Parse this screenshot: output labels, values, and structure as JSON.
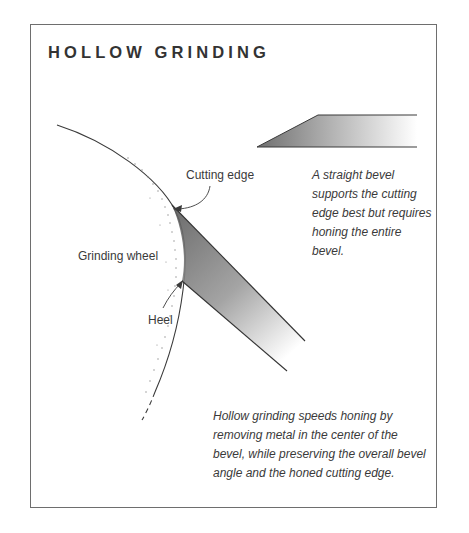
{
  "title": "HOLLOW GRINDING",
  "labels": {
    "cutting_edge": "Cutting edge",
    "grinding_wheel": "Grinding wheel",
    "heel": "Heel"
  },
  "captions": {
    "straight_bevel": "A straight bevel supports the cutting edge best but requires honing the entire bevel.",
    "hollow_grinding": "Hollow grinding speeds honing by removing metal in the center of the bevel, while preserving the overall bevel angle and the honed cutting edge."
  },
  "colors": {
    "frame": "#6e6e6e",
    "ink": "#333333",
    "shade_dark": "#6a6a6a",
    "shade_light": "#f2f2f2"
  }
}
